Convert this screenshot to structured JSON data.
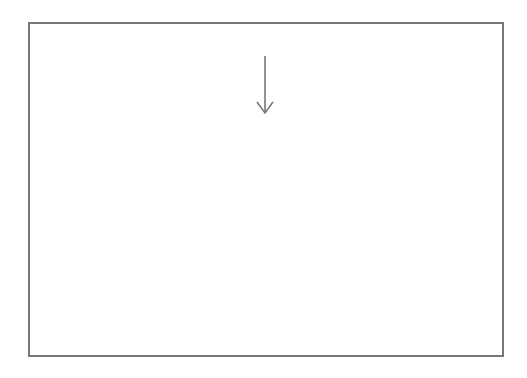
{
  "figure": {
    "annotation_label": "Adapt",
    "annotation_arrow_x": 265,
    "frame": {
      "x": 29,
      "y": 23,
      "width": 474,
      "height": 333
    },
    "baseline_y": 350,
    "full_peak_y": 134,
    "half_width": 104,
    "colors": {
      "frame": "#777777",
      "solid_curve": "#555555",
      "dashed_curve": "#cccccc",
      "arrow": "#777777",
      "text": "#333333"
    }
  },
  "chart_data": {
    "type": "line",
    "title": "",
    "annotation": "Adapt",
    "xlabel": "",
    "ylabel": "",
    "grid": false,
    "series": [
      {
        "name": "pre-adaptation (dashed)",
        "style": "dashed",
        "peaks_x": [
          213,
          240,
          265,
          292,
          318
        ],
        "peaks_amplitude": [
          1,
          1,
          1,
          1,
          1
        ]
      },
      {
        "name": "post-adaptation (solid)",
        "style": "solid",
        "peaks_x": [
          134,
          161,
          187,
          213,
          240,
          265,
          292,
          318,
          344,
          371,
          398
        ],
        "peaks_amplitude": [
          1,
          1,
          1,
          0.93,
          0.79,
          0.68,
          0.79,
          0.93,
          1,
          1,
          1
        ]
      }
    ]
  }
}
